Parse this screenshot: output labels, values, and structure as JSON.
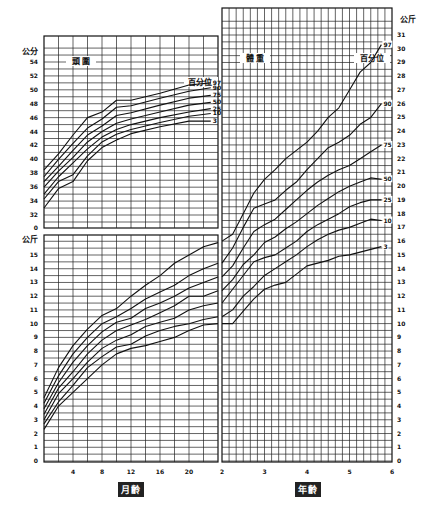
{
  "chart_data": [
    {
      "type": "line",
      "title": "頭圍",
      "ylabel": "公分",
      "xlabel": "月齡",
      "legend_title": "百分位",
      "x_unit": "months",
      "xlim": [
        0,
        24
      ],
      "ylim": [
        32,
        56
      ],
      "y_ticks": [
        0,
        32,
        34,
        36,
        38,
        40,
        42,
        44,
        46,
        48,
        50,
        52,
        54
      ],
      "x": [
        0,
        2,
        4,
        6,
        8,
        10,
        12,
        16,
        20,
        23
      ],
      "series": [
        {
          "name": "97",
          "values": [
            38.5,
            40.8,
            43.5,
            46,
            46.8,
            48.5,
            48.5,
            49.5,
            50.7,
            51
          ]
        },
        {
          "name": "90",
          "values": [
            37.5,
            40,
            42.3,
            44.5,
            45.8,
            47.5,
            47.7,
            48.8,
            49.8,
            50.3
          ]
        },
        {
          "name": "75",
          "values": [
            36.8,
            39,
            41.3,
            43.5,
            44.8,
            46.3,
            46.7,
            47.8,
            48.8,
            49.2
          ]
        },
        {
          "name": "50",
          "values": [
            36,
            38.3,
            40.3,
            42.5,
            44,
            45.2,
            45.8,
            46.8,
            47.8,
            48.2
          ]
        },
        {
          "name": "25",
          "values": [
            35,
            37.5,
            39.5,
            41.5,
            43.2,
            44.3,
            45,
            46,
            46.8,
            47.3
          ]
        },
        {
          "name": "10",
          "values": [
            34.3,
            36.8,
            37.8,
            40.5,
            42.5,
            43.6,
            44.3,
            45.3,
            46.2,
            46.6
          ]
        },
        {
          "name": "3",
          "values": [
            33,
            35.8,
            36.8,
            39.8,
            41.7,
            42.8,
            43.7,
            44.7,
            45.5,
            45.5
          ]
        }
      ]
    },
    {
      "type": "line",
      "title": "",
      "ylabel": "公斤",
      "xlabel": "月齡",
      "x_unit": "months",
      "xlim": [
        0,
        24
      ],
      "ylim": [
        0,
        16
      ],
      "x_ticks": [
        4,
        8,
        12,
        16,
        20
      ],
      "y_ticks": [
        0,
        1,
        2,
        3,
        4,
        5,
        6,
        7,
        8,
        9,
        10,
        11,
        12,
        13,
        14,
        15
      ],
      "x": [
        0,
        2,
        4,
        6,
        8,
        10,
        12,
        14,
        16,
        18,
        20,
        22,
        24
      ],
      "series": [
        {
          "name": "97",
          "values": [
            4.6,
            6.8,
            8.4,
            9.6,
            10.6,
            11.1,
            12,
            12.8,
            13.5,
            14.4,
            15,
            15.6,
            15.9
          ]
        },
        {
          "name": "90",
          "values": [
            4.2,
            6.2,
            7.8,
            9,
            10,
            10.5,
            11.1,
            11.8,
            12.3,
            12.8,
            13.5,
            14,
            14.4
          ]
        },
        {
          "name": "75",
          "values": [
            3.8,
            5.7,
            7.2,
            8.4,
            9.4,
            10.1,
            10.4,
            11.1,
            11.5,
            12,
            12.6,
            13,
            13.4
          ]
        },
        {
          "name": "50",
          "values": [
            3.4,
            5.3,
            6.5,
            7.8,
            8.8,
            9.5,
            9.9,
            10.3,
            10.8,
            11.3,
            12,
            12,
            12.4
          ]
        },
        {
          "name": "25",
          "values": [
            3.0,
            4.9,
            6,
            7.2,
            8.2,
            8.8,
            9.2,
            9.8,
            10.1,
            10.4,
            11,
            11.3,
            11.5
          ]
        },
        {
          "name": "10",
          "values": [
            2.7,
            4.3,
            5.5,
            6.8,
            7.6,
            8.3,
            8.5,
            9.1,
            9.5,
            9.8,
            10,
            10.3,
            10.5
          ]
        },
        {
          "name": "3",
          "values": [
            2.3,
            4,
            5,
            6,
            7,
            7.8,
            8.2,
            8.4,
            8.7,
            9,
            9.5,
            9.9,
            10
          ]
        }
      ]
    },
    {
      "type": "line",
      "title": "體重",
      "ylabel": "公斤",
      "xlabel": "年齡",
      "legend_title": "百分位",
      "x_unit": "years",
      "xlim": [
        2,
        6
      ],
      "ylim": [
        0,
        31
      ],
      "x_ticks": [
        2,
        3,
        4,
        5,
        6
      ],
      "y_ticks": [
        0,
        1,
        2,
        3,
        4,
        5,
        6,
        7,
        8,
        9,
        10,
        11,
        12,
        13,
        14,
        15,
        16,
        17,
        18,
        19,
        20,
        21,
        22,
        23,
        24,
        25,
        26,
        27,
        28,
        29,
        30,
        31
      ],
      "x": [
        2,
        2.25,
        2.5,
        2.75,
        3,
        3.25,
        3.5,
        3.75,
        4,
        4.25,
        4.5,
        4.75,
        5,
        5.25,
        5.5,
        5.75
      ],
      "series": [
        {
          "name": "97",
          "values": [
            16,
            16.5,
            18,
            19.5,
            20.5,
            21.2,
            22,
            22.6,
            23.2,
            24,
            25,
            25.7,
            27,
            28.3,
            29,
            30.3
          ]
        },
        {
          "name": "90",
          "values": [
            14.4,
            15.5,
            17,
            18.4,
            18.7,
            19,
            19.7,
            20.3,
            21.2,
            22,
            22.8,
            23.2,
            23.7,
            24.5,
            25,
            26
          ]
        },
        {
          "name": "75",
          "values": [
            13.4,
            14.2,
            15.5,
            16.7,
            17.2,
            17.6,
            18.3,
            19,
            19.7,
            20.3,
            20.8,
            21.2,
            21.5,
            22,
            22.5,
            23
          ]
        },
        {
          "name": "50",
          "values": [
            12.4,
            13.2,
            14.3,
            15,
            15.9,
            16.3,
            16.9,
            17.4,
            18,
            18.6,
            19.1,
            19.6,
            20,
            20.3,
            20.6,
            20.5
          ]
        },
        {
          "name": "25",
          "values": [
            11.5,
            12.5,
            13.5,
            14.5,
            14.8,
            15,
            15.5,
            16,
            16.7,
            17.2,
            17.6,
            18,
            18.5,
            18.8,
            19,
            19
          ]
        },
        {
          "name": "10",
          "values": [
            10.5,
            11,
            12,
            12.7,
            13.5,
            14,
            14.5,
            15,
            15.6,
            16.1,
            16.5,
            16.8,
            17,
            17.3,
            17.6,
            17.5
          ]
        },
        {
          "name": "3",
          "values": [
            10,
            10,
            10.9,
            11.8,
            12.5,
            12.8,
            13,
            13.6,
            14.2,
            14.4,
            14.6,
            14.9,
            15,
            15.2,
            15.4,
            15.6
          ]
        }
      ]
    }
  ],
  "labels": {
    "head_title": "頭 圍",
    "weight_title": "體 重",
    "percentile_label": "百分位",
    "unit_cm": "公分",
    "unit_kg": "公斤",
    "x_months": "月齡",
    "x_years": "年齡",
    "percentiles": [
      "97",
      "90",
      "75",
      "50",
      "25",
      "10",
      "3"
    ],
    "caption": "（圖說文字，過淡無法辨識）"
  }
}
